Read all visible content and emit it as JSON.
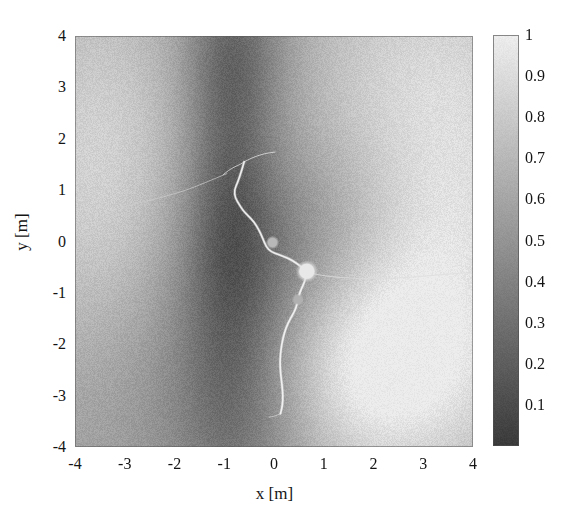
{
  "figure": {
    "kind": "scalar-field-heatmap-with-trajectory",
    "background_color": "#ffffff",
    "plot_box": {
      "left": 75,
      "top": 36,
      "width": 398,
      "height": 411
    }
  },
  "axes": {
    "x_title": "x [m]",
    "y_title": "y [m]",
    "x_ticks": [
      "-4",
      "-3",
      "-2",
      "-1",
      "0",
      "1",
      "2",
      "3",
      "4"
    ],
    "x_tick_values": [
      -4,
      -3,
      -2,
      -1,
      0,
      1,
      2,
      3,
      4
    ],
    "y_ticks": [
      "4",
      "3",
      "2",
      "1",
      "0",
      "-1",
      "-2",
      "-3",
      "-4"
    ],
    "y_tick_values": [
      4,
      3,
      2,
      1,
      0,
      -1,
      -2,
      -3,
      -4
    ],
    "xlim": [
      -4,
      4
    ],
    "ylim": [
      -4,
      4
    ]
  },
  "colorbar": {
    "orientation": "vertical",
    "position": "right",
    "vmin": 0,
    "vmax": 1,
    "colormap": "gray",
    "low_color": "#3a3a3a",
    "high_color": "#ededed",
    "tick_labels": [
      "1",
      "0.9",
      "0.8",
      "0.7",
      "0.6",
      "0.5",
      "0.4",
      "0.3",
      "0.2",
      "0.1"
    ],
    "tick_values": [
      1,
      0.9,
      0.8,
      0.7,
      0.6,
      0.5,
      0.4,
      0.3,
      0.2,
      0.1
    ]
  },
  "chart_data": {
    "type": "heatmap",
    "title": "",
    "xlabel": "x [m]",
    "ylabel": "y [m]",
    "xlim": [
      -4,
      4
    ],
    "ylim": [
      -4,
      4
    ],
    "zlim": [
      0,
      1
    ],
    "colormap": "gray",
    "grid": false,
    "legend": "none",
    "colorbar_ticks": [
      0.1,
      0.2,
      0.3,
      0.4,
      0.5,
      0.6,
      0.7,
      0.8,
      0.9,
      1
    ],
    "noise_amplitude": 0.055,
    "field_description": "Smooth scalar field in [0,1]; bright (near 1) lobe in lower-right quadrant, bright plateau along the left edge and upper-right, with a dark vertical valley near x = -1 extending from y = 4 down to y = -4 and a dark saddle through the centre.",
    "field_features": [
      {
        "name": "bright-lobe-lower-right",
        "cx": 2.2,
        "cy": -2.3,
        "sigma_x": 1.7,
        "sigma_y": 1.5,
        "amplitude": 0.46
      },
      {
        "name": "bright-plateau-left",
        "cx": -3.6,
        "cy": 1.4,
        "sigma_x": 1.5,
        "sigma_y": 3.0,
        "amplitude": 0.3
      },
      {
        "name": "bright-plateau-upper-right",
        "cx": 3.2,
        "cy": 3.0,
        "sigma_x": 1.9,
        "sigma_y": 1.8,
        "amplitude": 0.24
      },
      {
        "name": "bright-band-right-mid",
        "cx": 3.7,
        "cy": 0.2,
        "sigma_x": 1.2,
        "sigma_y": 1.4,
        "amplitude": 0.16
      },
      {
        "name": "dark-valley-vertical",
        "cx": -0.9,
        "cy": 1.6,
        "sigma_x": 0.62,
        "sigma_y": 3.2,
        "amplitude": -0.3
      },
      {
        "name": "dark-saddle-centre",
        "cx": -0.1,
        "cy": -0.4,
        "sigma_x": 1.35,
        "sigma_y": 1.5,
        "amplitude": -0.26
      },
      {
        "name": "dark-lower-centre",
        "cx": -0.6,
        "cy": -3.3,
        "sigma_x": 1.1,
        "sigma_y": 1.5,
        "amplitude": -0.2
      },
      {
        "name": "dark-upper-centre",
        "cx": -0.6,
        "cy": 3.6,
        "sigma_x": 0.8,
        "sigma_y": 1.0,
        "amplitude": -0.13
      },
      {
        "name": "mid-band-left-lower",
        "cx": -2.7,
        "cy": -2.4,
        "sigma_x": 1.4,
        "sigma_y": 1.6,
        "amplitude": -0.07
      }
    ],
    "field_base_level": 0.6,
    "trajectory": {
      "name": "main-path",
      "color": "#f2f2f2",
      "line_width": 1.6,
      "points": [
        [
          -0.6,
          1.55
        ],
        [
          -0.66,
          1.35
        ],
        [
          -0.73,
          1.15
        ],
        [
          -0.8,
          1.0
        ],
        [
          -0.78,
          0.85
        ],
        [
          -0.7,
          0.72
        ],
        [
          -0.62,
          0.6
        ],
        [
          -0.52,
          0.5
        ],
        [
          -0.4,
          0.38
        ],
        [
          -0.3,
          0.22
        ],
        [
          -0.22,
          0.05
        ],
        [
          -0.16,
          -0.1
        ],
        [
          -0.06,
          -0.2
        ],
        [
          0.1,
          -0.26
        ],
        [
          0.28,
          -0.32
        ],
        [
          0.45,
          -0.42
        ],
        [
          0.58,
          -0.52
        ],
        [
          0.66,
          -0.6
        ],
        [
          0.62,
          -0.78
        ],
        [
          0.55,
          -0.92
        ],
        [
          0.5,
          -1.05
        ],
        [
          0.47,
          -1.2
        ],
        [
          0.42,
          -1.35
        ],
        [
          0.33,
          -1.5
        ],
        [
          0.24,
          -1.68
        ],
        [
          0.18,
          -1.88
        ],
        [
          0.14,
          -2.1
        ],
        [
          0.12,
          -2.32
        ],
        [
          0.13,
          -2.55
        ],
        [
          0.16,
          -2.78
        ],
        [
          0.18,
          -3.0
        ],
        [
          0.17,
          -3.2
        ],
        [
          0.13,
          -3.35
        ]
      ]
    },
    "branches": [
      {
        "name": "branch-upper-right",
        "color": "#e6e6e6",
        "line_width": 1.0,
        "points": [
          [
            -0.6,
            1.55
          ],
          [
            -0.46,
            1.62
          ],
          [
            -0.3,
            1.68
          ],
          [
            -0.14,
            1.72
          ],
          [
            0.02,
            1.74
          ]
        ]
      },
      {
        "name": "branch-upper-left-stub",
        "color": "#e0e0e0",
        "line_width": 1.0,
        "points": [
          [
            -0.6,
            1.55
          ],
          [
            -0.68,
            1.5
          ],
          [
            -0.8,
            1.45
          ],
          [
            -0.92,
            1.38
          ],
          [
            -1.02,
            1.3
          ]
        ]
      },
      {
        "name": "branch-left-long",
        "color": "#cfcfcf",
        "line_width": 0.9,
        "points": [
          [
            -0.95,
            1.32
          ],
          [
            -1.3,
            1.18
          ],
          [
            -1.7,
            1.02
          ],
          [
            -2.1,
            0.9
          ],
          [
            -2.5,
            0.8
          ],
          [
            -2.85,
            0.72
          ],
          [
            -3.05,
            0.66
          ]
        ]
      },
      {
        "name": "branch-right-long",
        "color": "#dcdcdc",
        "line_width": 1.0,
        "points": [
          [
            0.66,
            -0.6
          ],
          [
            0.95,
            -0.66
          ],
          [
            1.3,
            -0.7
          ],
          [
            1.7,
            -0.72
          ],
          [
            2.2,
            -0.72
          ],
          [
            2.7,
            -0.7
          ],
          [
            3.2,
            -0.66
          ],
          [
            3.7,
            -0.62
          ],
          [
            4.0,
            -0.6
          ]
        ]
      },
      {
        "name": "branch-bottom-stub",
        "color": "#d8d8d8",
        "line_width": 0.9,
        "points": [
          [
            0.13,
            -3.35
          ],
          [
            0.02,
            -3.4
          ],
          [
            -0.1,
            -3.42
          ]
        ]
      }
    ],
    "nodes": [
      {
        "name": "node-main",
        "x": 0.66,
        "y": -0.58,
        "radius_px": 7.5,
        "color": "#e8e8e8",
        "label": ""
      },
      {
        "name": "node-upper",
        "x": -0.03,
        "y": -0.02,
        "radius_px": 4.5,
        "color": "#b8b8b8",
        "label": ""
      },
      {
        "name": "node-lower",
        "x": 0.48,
        "y": -1.13,
        "radius_px": 4.0,
        "color": "#b0b0b0",
        "label": ""
      }
    ]
  }
}
